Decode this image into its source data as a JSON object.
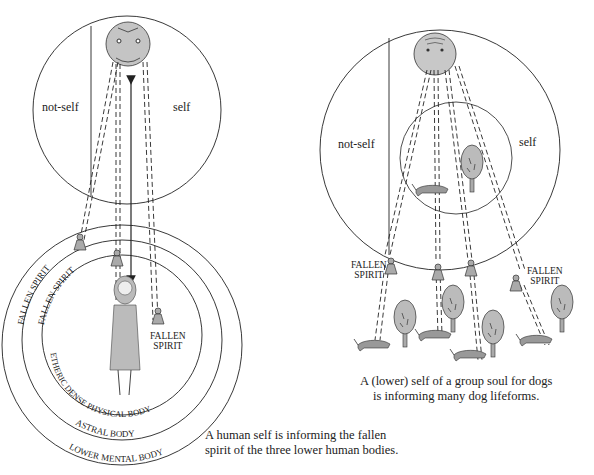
{
  "left_diagram": {
    "self_circle": {
      "not_self_label": "not-self",
      "self_label": "self"
    },
    "fallen_spirit_label": "FALLEN SPIRIT",
    "fallen_spirit_inner_label_line1": "FALLEN",
    "fallen_spirit_inner_label_line2": "SPIRIT",
    "rings": [
      {
        "label": "ETHERIC DENSE PHYSICAL BODY",
        "ring_label_fallen": "FALLEN SPIRIT"
      },
      {
        "label": "ASTRAL BODY",
        "ring_label_fallen": "FALLEN SPIRIT"
      },
      {
        "label": "LOWER MENTAL BODY",
        "ring_label_fallen": "FALLEN SPIRIT"
      }
    ],
    "caption_line1": "A human self is informing the fallen",
    "caption_line2": "spirit of the three lower human bodies."
  },
  "right_diagram": {
    "self_circle": {
      "not_self_label": "not-self",
      "self_label": "self"
    },
    "fallen_left_line1": "FALLEN",
    "fallen_left_line2": "SPIRIT",
    "fallen_right_line1": "FALLEN",
    "fallen_right_line2": "SPIRIT",
    "caption_line1": "A (lower) self of a group soul for dogs",
    "caption_line2": "is informing many dog lifeforms."
  },
  "colors": {
    "line": "#222222",
    "fill_gray": "#b8b8b8",
    "background": "#ffffff"
  }
}
